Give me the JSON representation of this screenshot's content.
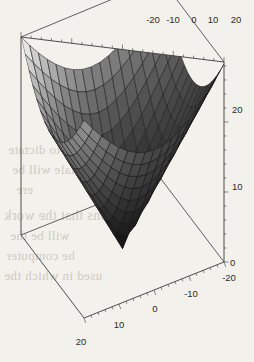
{
  "figure": {
    "kind": "3d-surface-plot",
    "background_color": "#f3f1ec",
    "line_color": "#3a3a3a",
    "width": 254,
    "height": 362
  },
  "axes": {
    "x_axis": {
      "position": "top",
      "ticks": [
        "-20",
        "-10",
        "0",
        "10",
        "20"
      ],
      "range": [
        -20,
        20
      ],
      "minor_ticks_per_interval": 5
    },
    "y_axis": {
      "position": "bottom-right",
      "ticks": [
        "-20",
        "-10",
        "0",
        "10",
        "20"
      ],
      "range": [
        -20,
        20
      ],
      "minor_ticks_per_interval": 5
    },
    "z_axis": {
      "position": "right",
      "ticks": [
        "0",
        "10",
        "20"
      ],
      "range": [
        0,
        28
      ],
      "minor_ticks_per_interval": 5
    }
  },
  "tick_labels": {
    "top": [
      {
        "text": "-20",
        "x": 153,
        "y": 23
      },
      {
        "text": "-10",
        "x": 173,
        "y": 23
      },
      {
        "text": "0",
        "x": 194,
        "y": 23
      },
      {
        "text": "10",
        "x": 213,
        "y": 23
      },
      {
        "text": "20",
        "x": 236,
        "y": 23
      }
    ],
    "right": [
      {
        "text": "20",
        "x": 232,
        "y": 113
      },
      {
        "text": "10",
        "x": 232,
        "y": 190
      },
      {
        "text": "0",
        "x": 230,
        "y": 266
      }
    ],
    "bottom": [
      {
        "text": "-20",
        "x": 229,
        "y": 281
      },
      {
        "text": "-10",
        "x": 191,
        "y": 297
      },
      {
        "text": "0",
        "x": 155,
        "y": 312
      },
      {
        "text": "10",
        "x": 119,
        "y": 328
      },
      {
        "text": "20",
        "x": 81,
        "y": 345
      }
    ]
  },
  "bleed_text": [
    {
      "text": "an to dictate",
      "x": 8,
      "y": 142,
      "size": 13
    },
    {
      "text": "tale will be",
      "x": 12,
      "y": 162,
      "size": 13
    },
    {
      "text": "ere",
      "x": 16,
      "y": 182,
      "size": 13
    },
    {
      "text": "tions that the work",
      "x": 4,
      "y": 208,
      "size": 14
    },
    {
      "text": "will be the",
      "x": 10,
      "y": 228,
      "size": 13
    },
    {
      "text": "he computer",
      "x": 6,
      "y": 248,
      "size": 13
    },
    {
      "text": "used in which the",
      "x": 4,
      "y": 268,
      "size": 13
    }
  ],
  "chart_data": {
    "type": "surface",
    "title": "",
    "xlabel": "",
    "ylabel": "",
    "zlabel": "",
    "function": "z = sqrt(x^2 + y^2)",
    "x": [
      -20,
      -16,
      -12,
      -8,
      -4,
      0,
      4,
      8,
      12,
      16,
      20
    ],
    "y": [
      -20,
      -16,
      -12,
      -8,
      -4,
      0,
      4,
      8,
      12,
      16,
      20
    ],
    "xlim": [
      -20,
      20
    ],
    "ylim": [
      -20,
      20
    ],
    "zlim": [
      0,
      28.28
    ],
    "grid": true,
    "legend": false,
    "mesh_n": 16,
    "shading": "grayscale",
    "z": [
      [
        28.28,
        25.61,
        23.32,
        21.54,
        20.4,
        20.0,
        20.4,
        21.54,
        23.32,
        25.61,
        28.28
      ],
      [
        25.61,
        22.63,
        20.0,
        17.89,
        16.49,
        16.0,
        16.49,
        17.89,
        20.0,
        22.63,
        25.61
      ],
      [
        23.32,
        20.0,
        16.97,
        14.42,
        12.65,
        12.0,
        12.65,
        14.42,
        16.97,
        20.0,
        23.32
      ],
      [
        21.54,
        17.89,
        14.42,
        11.31,
        8.94,
        8.0,
        8.94,
        11.31,
        14.42,
        17.89,
        21.54
      ],
      [
        20.4,
        16.49,
        12.65,
        8.94,
        5.66,
        4.0,
        5.66,
        8.94,
        12.65,
        16.49,
        20.4
      ],
      [
        20.0,
        16.0,
        12.0,
        8.0,
        4.0,
        0.0,
        4.0,
        8.0,
        12.0,
        16.0,
        20.0
      ],
      [
        20.4,
        16.49,
        12.65,
        8.94,
        5.66,
        4.0,
        5.66,
        8.94,
        12.65,
        16.49,
        20.4
      ],
      [
        21.54,
        17.89,
        14.42,
        11.31,
        8.94,
        8.0,
        8.94,
        11.31,
        14.42,
        17.89,
        21.54
      ],
      [
        23.32,
        20.0,
        16.97,
        14.42,
        12.65,
        12.0,
        12.65,
        14.42,
        16.97,
        20.0,
        23.32
      ],
      [
        25.61,
        22.63,
        20.0,
        17.89,
        16.49,
        16.0,
        16.49,
        17.89,
        20.0,
        22.63,
        25.61
      ],
      [
        28.28,
        25.61,
        23.32,
        21.54,
        20.4,
        20.0,
        20.4,
        21.54,
        23.32,
        25.61,
        28.28
      ]
    ]
  }
}
